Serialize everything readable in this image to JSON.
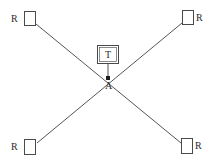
{
  "diagram": {
    "canvas": {
      "width": 217,
      "height": 166,
      "background": "#ffffff"
    },
    "colors": {
      "line": "#555555",
      "box_stroke": "#4a4a4a",
      "text": "#2b2b2b",
      "junction": "#1c1c1c",
      "background": "#ffffff"
    },
    "nodes": [
      {
        "id": "r-top-left",
        "label": "R",
        "label_side": "left",
        "x": 24,
        "y": 11,
        "w": 12,
        "h": 15
      },
      {
        "id": "r-top-right",
        "label": "R",
        "label_side": "right",
        "x": 182,
        "y": 10,
        "w": 12,
        "h": 15
      },
      {
        "id": "r-bottom-left",
        "label": "R",
        "label_side": "left",
        "x": 24,
        "y": 139,
        "w": 12,
        "h": 16
      },
      {
        "id": "r-bottom-right",
        "label": "R",
        "label_side": "right",
        "x": 181,
        "y": 138,
        "w": 12,
        "h": 16
      },
      {
        "id": "t-center",
        "label": "T",
        "label_side": "inside",
        "x": 97,
        "y": 45,
        "w": 22,
        "h": 19
      }
    ],
    "junction": {
      "id": "a-point",
      "label": "A",
      "x": 108,
      "y": 78
    },
    "edges": [
      {
        "id": "edge-tl-br",
        "from": "r-top-left",
        "to": "r-bottom-right"
      },
      {
        "id": "edge-tr-bl",
        "from": "r-top-right",
        "to": "r-bottom-left"
      },
      {
        "id": "edge-t-a",
        "from": "t-center",
        "to": "a-point"
      }
    ],
    "labels": {
      "receiver": "R",
      "transmitter": "T",
      "antenna_point": "A"
    }
  }
}
